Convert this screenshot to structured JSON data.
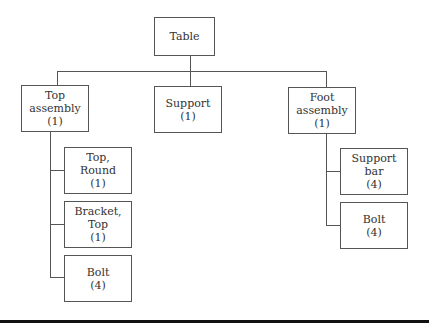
{
  "diagram": {
    "type": "hierarchy",
    "root": {
      "id": "table",
      "lines": [
        "Table"
      ]
    },
    "level1": [
      {
        "id": "top-assembly",
        "lines": [
          "Top",
          "assembly",
          "(1)"
        ]
      },
      {
        "id": "support",
        "lines": [
          "Support",
          "(1)"
        ]
      },
      {
        "id": "foot-assembly",
        "lines": [
          "Foot",
          "assembly",
          "(1)"
        ]
      }
    ],
    "top_assembly_children": [
      {
        "id": "top-round",
        "lines": [
          "Top,",
          "Round",
          "(1)"
        ]
      },
      {
        "id": "bracket-top",
        "lines": [
          "Bracket,",
          "Top",
          "(1)"
        ]
      },
      {
        "id": "bolt-top",
        "lines": [
          "Bolt",
          "(4)"
        ]
      }
    ],
    "foot_assembly_children": [
      {
        "id": "support-bar",
        "lines": [
          "Support",
          "bar",
          "(4)"
        ]
      },
      {
        "id": "bolt-foot",
        "lines": [
          "Bolt",
          "(4)"
        ]
      }
    ],
    "colors": {
      "line": "#555555",
      "box_border": "#555555",
      "rule": "#111111",
      "background": "#ffffff"
    }
  }
}
